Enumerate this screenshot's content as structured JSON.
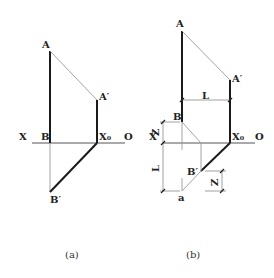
{
  "panels": {
    "a": {
      "caption": "(a)",
      "labels": {
        "A": "A",
        "A_prime": "A′",
        "X": "X",
        "B": "B",
        "X0": "X₀",
        "O": "O",
        "B_prime": "B′"
      }
    },
    "b": {
      "caption": "(b)",
      "labels": {
        "A": "A",
        "A_prime": "A′",
        "L_top": "L",
        "B": "B",
        "X": "X",
        "X0": "X₀",
        "O": "O",
        "Z_left": "Z",
        "L_left": "L",
        "B_prime": "B′",
        "Z_right": "Z",
        "a": "a"
      }
    }
  }
}
